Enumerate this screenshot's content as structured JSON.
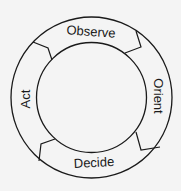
{
  "diagram": {
    "stages": [
      {
        "id": "observe",
        "label": "Observe"
      },
      {
        "id": "orient",
        "label": "Orient"
      },
      {
        "id": "decide",
        "label": "Decide"
      },
      {
        "id": "act",
        "label": "Act"
      }
    ],
    "flow_direction": "clockwise",
    "colors": {
      "stroke": "#1a1a1a",
      "background": "#f4f4f4",
      "text": "#1a1a1a"
    }
  }
}
